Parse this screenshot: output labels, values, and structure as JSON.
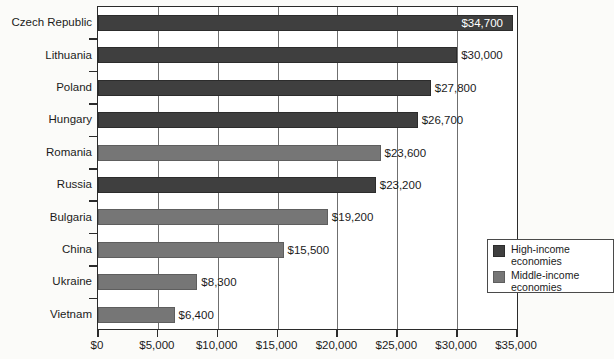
{
  "chart_data": {
    "type": "bar",
    "orientation": "horizontal",
    "title": "",
    "subtitle": "",
    "xlabel": "",
    "ylabel": "",
    "xlim": [
      0,
      35000
    ],
    "xtick_step": 5000,
    "xticks": [
      "$0",
      "$5,000",
      "$10,000",
      "$15,000",
      "$20,000",
      "$25,000",
      "$30,000",
      "$35,000"
    ],
    "xtick_values": [
      0,
      5000,
      10000,
      15000,
      20000,
      25000,
      30000,
      35000
    ],
    "grid": "vertical",
    "legend_position": "inside-bottom-right",
    "categories": [
      "Czech Republic",
      "Lithuania",
      "Poland",
      "Hungary",
      "Romania",
      "Russia",
      "Bulgaria",
      "China",
      "Ukraine",
      "Vietnam"
    ],
    "values": [
      34700,
      30000,
      27800,
      26700,
      23600,
      23200,
      19200,
      15500,
      8300,
      6400
    ],
    "value_labels": [
      "$34,700",
      "$30,000",
      "$27,800",
      "$26,700",
      "$23,600",
      "$23,200",
      "$19,200",
      "$15,500",
      "$8,300",
      "$6,400"
    ],
    "groups": [
      "high",
      "high",
      "high",
      "high",
      "middle",
      "high",
      "middle",
      "middle",
      "middle",
      "middle"
    ],
    "label_placement": [
      "inside",
      "outside",
      "outside",
      "outside",
      "outside",
      "outside",
      "outside",
      "outside",
      "outside",
      "outside"
    ],
    "legend": [
      {
        "key": "high",
        "label": "High-income\neconomies",
        "color": "#3f3f3f"
      },
      {
        "key": "middle",
        "label": "Middle-income\neconomies",
        "color": "#767676"
      }
    ]
  },
  "colors": {
    "high_income": "#3f3f3f",
    "middle_income": "#767676",
    "axis": "#2b2b2b",
    "gridline": "#6f6f6f",
    "plot_background": "#ffffff",
    "page_background": "#fbfbf9",
    "text": "#1b1b1b",
    "inside_label_text": "#ffffff"
  }
}
